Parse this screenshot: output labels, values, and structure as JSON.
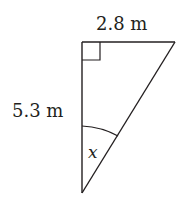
{
  "diagram": {
    "type": "right-triangle",
    "top_side_label": "2.8 m",
    "left_side_label": "5.3 m",
    "angle_label": "x",
    "right_angle_marker": true,
    "stroke_color": "#231f20"
  }
}
